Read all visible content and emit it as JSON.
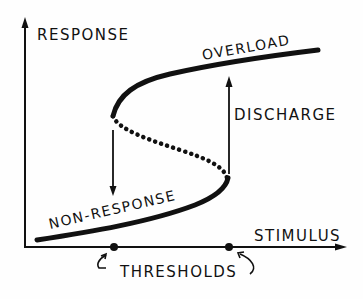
{
  "diagram": {
    "type": "hysteresis S-curve (bistable response)",
    "axes": {
      "y_label": "RESPONSE",
      "x_label": "STIMULUS"
    },
    "branches": {
      "upper": "OVERLOAD",
      "lower": "NON-RESPONSE",
      "middle": "unstable (dotted)"
    },
    "transitions": {
      "up_arrow_label": "DISCHARGE",
      "down_arrow_label": ""
    },
    "thresholds_label": "THRESHOLDS",
    "threshold_count": 2,
    "colors": {
      "ink": "#111111",
      "background": "#fefefe"
    }
  }
}
